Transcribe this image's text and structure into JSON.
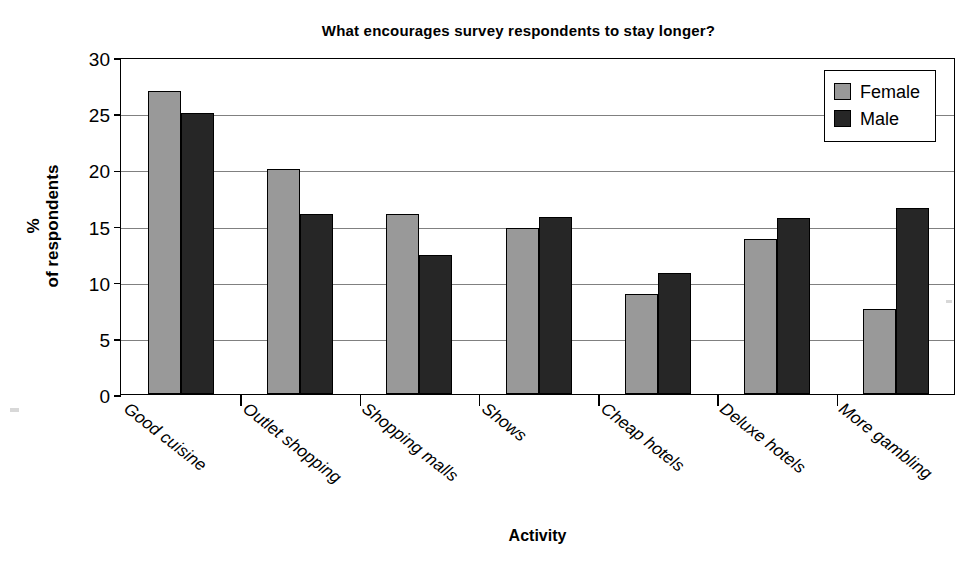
{
  "chart_data": {
    "type": "bar",
    "title": "What encourages survey respondents to stay longer?",
    "xlabel": "Activity",
    "ylabel": "%\nof respondents",
    "ylabel_line1": "%",
    "ylabel_line2": "of respondents",
    "categories": [
      "Good cuisine",
      "Outlet shopping",
      "Shopping malls",
      "Shows",
      "Cheap hotels",
      "Deluxe hotels",
      "More gambling"
    ],
    "series": [
      {
        "name": "Female",
        "color": "#999999",
        "values": [
          27.0,
          20.0,
          16.0,
          14.8,
          8.9,
          13.8,
          7.6
        ]
      },
      {
        "name": "Male",
        "color": "#262626",
        "values": [
          25.0,
          16.0,
          12.4,
          15.8,
          10.8,
          15.7,
          16.6
        ]
      }
    ],
    "ylim": [
      0,
      30
    ],
    "yticks": [
      0,
      5,
      10,
      15,
      20,
      25,
      30
    ],
    "ytick_labels": [
      "0",
      "5",
      "10",
      "15",
      "20",
      "25",
      "30"
    ],
    "grid": true,
    "legend_position": "top-right",
    "legend_entries": [
      "Female",
      "Male"
    ]
  }
}
